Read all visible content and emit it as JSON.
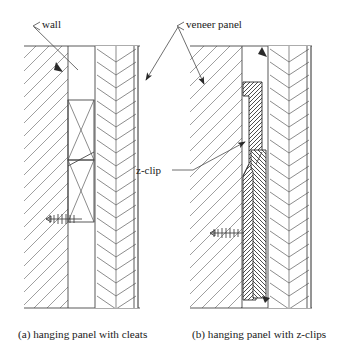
{
  "figure": {
    "title_visible": false,
    "background_color": "#ffffff",
    "line_color": "#3c3c3c",
    "hatch_color": "#6a6a6a",
    "text_color": "#1a1a1a"
  },
  "annotations": {
    "wall": {
      "label": "wall",
      "x": 42,
      "y": 24,
      "leader_from": [
        38,
        27
      ],
      "leader_to": [
        75,
        62
      ],
      "arrow": "none"
    },
    "veneer_panel": {
      "label": "veneer panel",
      "x": 186,
      "y": 24,
      "leader_a_from": [
        182,
        27
      ],
      "leader_a_to": [
        145,
        78
      ],
      "leader_b_from": [
        182,
        27
      ],
      "leader_b_to": [
        205,
        82
      ],
      "arrow": "filled-triangle"
    },
    "z_clip": {
      "label": "z-clip",
      "x": 159,
      "y": 170,
      "leader_from": [
        193,
        167
      ],
      "leader_to": [
        243,
        143
      ],
      "arrow": "filled-triangle"
    }
  },
  "panels": [
    {
      "id": "a",
      "caption": "(a) hanging panel with cleats",
      "caption_x": 18,
      "caption_y": 334,
      "frame": {
        "x": 24,
        "y": 46,
        "w": 116,
        "h": 262
      },
      "wall": {
        "name": "wall",
        "x": 24,
        "w": 44,
        "hatch": "diagonal-45",
        "hatch_spacing": 13
      },
      "cavity": {
        "x": 68,
        "w": 24
      },
      "veneer": {
        "name": "veneer panel",
        "x": 95,
        "w": 43,
        "hatch": "chevron",
        "chevron_rows": 20
      },
      "cleats": [
        {
          "name": "upper-cleat",
          "x": 68,
          "y": 100,
          "w": 26,
          "h": 60
        },
        {
          "name": "lower-cleat",
          "x": 68,
          "y": 160,
          "w": 26,
          "h": 62
        }
      ],
      "fastener": {
        "name": "screw",
        "x": 46,
        "y": 219,
        "length": 36,
        "orientation": "horizontal"
      }
    },
    {
      "id": "b",
      "caption": "(b) hanging panel with z-clips",
      "caption_x": 192,
      "caption_y": 334,
      "frame": {
        "x": 190,
        "y": 46,
        "w": 122,
        "h": 262
      },
      "wall": {
        "name": "wall",
        "x": 190,
        "w": 52,
        "hatch": "diagonal-45",
        "hatch_spacing": 13
      },
      "veneer": {
        "name": "veneer panel",
        "x": 268,
        "w": 43,
        "hatch": "chevron",
        "chevron_rows": 20
      },
      "clips": [
        {
          "name": "wall-side-z-clip",
          "hatch": "crosshatch-45",
          "top": 82,
          "bottom": 300
        },
        {
          "name": "panel-side-z-clip",
          "hatch": "crosshatch-135",
          "top": 150,
          "bottom": 298
        }
      ],
      "fastener": {
        "name": "screw",
        "x": 210,
        "y": 233,
        "length": 34,
        "orientation": "horizontal"
      }
    }
  ]
}
